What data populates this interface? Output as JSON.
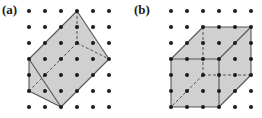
{
  "figures": [
    {
      "id": "a",
      "label": "(a)",
      "grid": {
        "cols": 6,
        "rows": 7
      },
      "fill_color": "#d0d0d0",
      "polygon": [
        [
          3,
          0
        ],
        [
          5,
          3
        ],
        [
          2,
          6
        ],
        [
          0,
          5
        ],
        [
          0,
          3
        ]
      ],
      "solid_edges": [
        [
          [
            3,
            0
          ],
          [
            5,
            3
          ]
        ],
        [
          [
            5,
            3
          ],
          [
            2,
            6
          ]
        ],
        [
          [
            2,
            6
          ],
          [
            0,
            5
          ]
        ],
        [
          [
            0,
            5
          ],
          [
            0,
            3
          ]
        ],
        [
          [
            0,
            3
          ],
          [
            3,
            0
          ]
        ],
        [
          [
            0,
            3
          ],
          [
            2,
            6
          ]
        ]
      ],
      "dashed_edges": [
        [
          [
            3,
            0
          ],
          [
            3,
            2
          ]
        ],
        [
          [
            3,
            2
          ],
          [
            5,
            3
          ]
        ],
        [
          [
            3,
            2
          ],
          [
            0,
            5
          ]
        ]
      ]
    },
    {
      "id": "b",
      "label": "(b)",
      "grid": {
        "cols": 6,
        "rows": 7
      },
      "fill_color": "#d0d0d0",
      "polygon": [
        [
          2,
          1
        ],
        [
          5,
          1
        ],
        [
          5,
          4
        ],
        [
          3,
          6
        ],
        [
          0,
          6
        ],
        [
          0,
          3
        ]
      ],
      "solid_edges": [
        [
          [
            0,
            3
          ],
          [
            3,
            3
          ]
        ],
        [
          [
            3,
            3
          ],
          [
            3,
            6
          ]
        ],
        [
          [
            3,
            6
          ],
          [
            0,
            6
          ]
        ],
        [
          [
            0,
            6
          ],
          [
            0,
            3
          ]
        ],
        [
          [
            0,
            3
          ],
          [
            2,
            1
          ]
        ],
        [
          [
            2,
            1
          ],
          [
            5,
            1
          ]
        ],
        [
          [
            5,
            1
          ],
          [
            5,
            4
          ]
        ],
        [
          [
            5,
            4
          ],
          [
            3,
            6
          ]
        ],
        [
          [
            3,
            3
          ],
          [
            5,
            1
          ]
        ]
      ],
      "dashed_edges": [
        [
          [
            2,
            1
          ],
          [
            2,
            4
          ]
        ],
        [
          [
            2,
            4
          ],
          [
            5,
            4
          ]
        ],
        [
          [
            2,
            4
          ],
          [
            0,
            6
          ]
        ]
      ]
    }
  ],
  "colors": {
    "dot": "#1a1a1a",
    "edge": "#555555",
    "fill": "#d0d0d0"
  }
}
